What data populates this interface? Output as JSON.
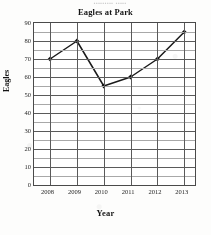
{
  "top_bleed_text": "......... .....",
  "chart_data": {
    "type": "line",
    "title": "Eagles at Park",
    "xlabel": "Year",
    "ylabel": "Eagles",
    "categories": [
      "2008",
      "2009",
      "2010",
      "2011",
      "2012",
      "2013"
    ],
    "x": [
      2008,
      2009,
      2010,
      2011,
      2012,
      2013
    ],
    "values": [
      70,
      80,
      55,
      60,
      70,
      85
    ],
    "series": [
      {
        "name": "Eagles",
        "values": [
          70,
          80,
          55,
          60,
          70,
          85
        ]
      }
    ],
    "ylim": [
      0,
      90
    ],
    "xlim": [
      2007.4,
      2013.4
    ],
    "ytick_labels": [
      "0",
      "10",
      "20",
      "30",
      "40",
      "50",
      "60",
      "70",
      "80",
      "90"
    ],
    "ytick_values": [
      0,
      10,
      20,
      30,
      40,
      50,
      60,
      70,
      80,
      90
    ],
    "yminor_values": [
      5,
      15,
      25,
      35,
      45,
      55,
      65,
      75,
      85
    ],
    "ytick_step": 10,
    "yminor_step": 5,
    "grid": true,
    "grid_minor": true,
    "legend": false,
    "legend_position": "none",
    "marker": "filled-diamond",
    "line_color": "#1a1a1a",
    "marker_color": "#111111",
    "grid_color": "#5a5a5a",
    "minor_grid_color": "#a8a8a8",
    "plot_border_color": "#4a4a4a",
    "background_color": "#ffffff",
    "annotations": []
  }
}
